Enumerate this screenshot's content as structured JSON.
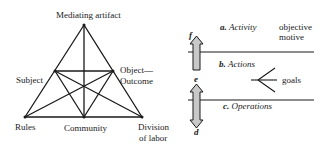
{
  "triangle": {
    "top_label": "Mediating artifact",
    "subject_label": "Subject",
    "object_label_line1": "Object—",
    "object_label_line2": "Outcome",
    "rules_label": "Rules",
    "community_label": "Community",
    "division_label_line1": "Division",
    "division_label_line2": "of labor"
  },
  "levels": {
    "activity_letter": "a.",
    "activity_label": "Activity",
    "actions_letter": "b.",
    "actions_label": "Actions",
    "operations_letter": "c.",
    "operations_label": "Operations",
    "objective_line1": "objective",
    "objective_line2": "motive",
    "goals_label": "goals",
    "arrow_top_letter": "f",
    "arrow_mid_letter": "e",
    "arrow_bottom_letter": "d"
  }
}
